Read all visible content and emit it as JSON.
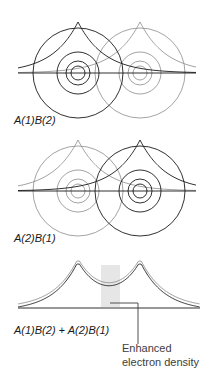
{
  "figure": {
    "background": "#ffffff",
    "width": 216,
    "height": 380
  },
  "panels": [
    {
      "id": "panel-a1b2",
      "label": "A(1)B(2)",
      "label_x": 14,
      "label_y": 124,
      "axis_y": 73,
      "axis_x1": 18,
      "axis_x2": 196,
      "atoms": [
        {
          "name": "atom-a",
          "cx": 78,
          "cy": 73,
          "emphasis": "dark",
          "color": "#1a1a1a",
          "stroke": 0.9,
          "radii": [
            7,
            12,
            21,
            45
          ],
          "peak_apex_y": 22
        },
        {
          "name": "atom-b",
          "cx": 140,
          "cy": 73,
          "emphasis": "light",
          "color": "#8c8c8c",
          "stroke": 0.8,
          "radii": [
            7,
            12,
            21,
            45
          ],
          "peak_apex_y": 22
        }
      ]
    },
    {
      "id": "panel-a2b1",
      "label": "A(2)B(1)",
      "label_x": 14,
      "label_y": 242,
      "axis_y": 191,
      "axis_x1": 18,
      "axis_x2": 196,
      "atoms": [
        {
          "name": "atom-a",
          "cx": 78,
          "cy": 191,
          "emphasis": "light",
          "color": "#8c8c8c",
          "stroke": 0.8,
          "radii": [
            7,
            12,
            21,
            45
          ],
          "peak_apex_y": 140
        },
        {
          "name": "atom-b",
          "cx": 140,
          "cy": 191,
          "emphasis": "dark",
          "color": "#1a1a1a",
          "stroke": 0.9,
          "radii": [
            7,
            12,
            21,
            45
          ],
          "peak_apex_y": 140
        }
      ]
    },
    {
      "id": "panel-sum",
      "label": "A(1)B(2) + A(2)B(1)",
      "label_x": 14,
      "label_y": 334,
      "axis_y": 308,
      "axis_x1": 18,
      "axis_x2": 200,
      "peaks": [
        {
          "name": "cusp-a",
          "x": 78,
          "apex_y": 262
        },
        {
          "name": "cusp-b",
          "x": 140,
          "apex_y": 262
        }
      ],
      "shaded_band": {
        "name": "enhanced-density-band",
        "x": 101,
        "y": 265,
        "width": 19,
        "height": 42,
        "color": "#e6e6e6"
      }
    }
  ],
  "annotation": {
    "name": "enhanced-electron-density",
    "lines": [
      "Enhanced",
      "electron density"
    ],
    "text_x": 122,
    "text_y": 352,
    "leader": {
      "horizontal_x1": 110,
      "horizontal_x2": 138,
      "horizontal_y": 303,
      "vertical_x": 138,
      "vertical_y1": 303,
      "vertical_y2": 344
    }
  },
  "colors": {
    "ink_dark": "#1a1a1a",
    "ink_light": "#8c8c8c",
    "shade": "#e6e6e6",
    "caption": "#3d3d3d"
  }
}
